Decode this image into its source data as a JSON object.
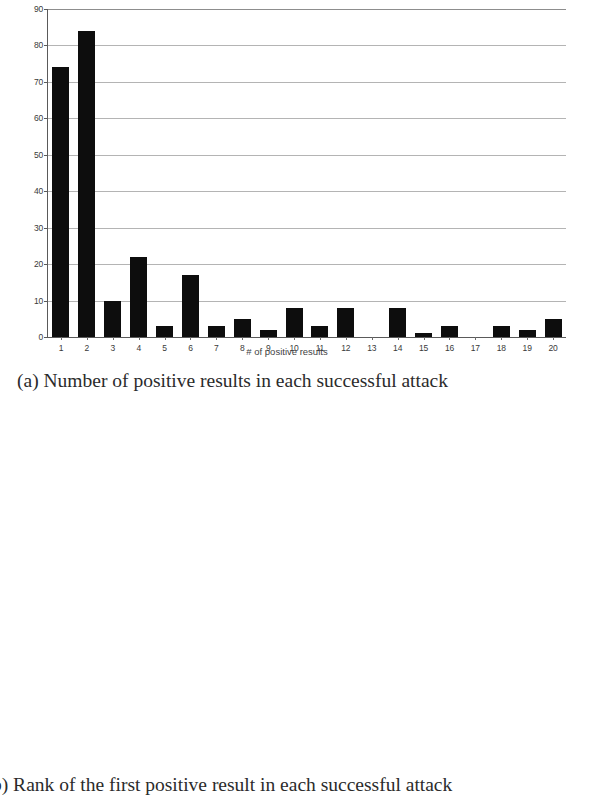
{
  "figure": {
    "caption_a": "(a) Number of positive results in each successful attack",
    "caption_b": "b) Rank of the first positive result in each successful attack"
  },
  "chart_data": [
    {
      "id": "chart-a",
      "type": "bar",
      "title": "",
      "xlabel": "# of positive results",
      "ylabel": "",
      "ylim": [
        0,
        90
      ],
      "ytick_step": 10,
      "yticks": [
        0,
        10,
        20,
        30,
        40,
        50,
        60,
        70,
        80,
        90
      ],
      "grid": true,
      "legend": "none",
      "bar_color": "#0d0d0d",
      "categories": [
        "1",
        "2",
        "3",
        "4",
        "5",
        "6",
        "7",
        "8",
        "9",
        "10",
        "11",
        "12",
        "13",
        "14",
        "15",
        "16",
        "17",
        "18",
        "19",
        "20"
      ],
      "values": [
        74,
        84,
        10,
        22,
        3,
        17,
        3,
        5,
        2,
        8,
        3,
        8,
        0,
        8,
        1,
        3,
        0,
        3,
        2,
        5
      ]
    },
    {
      "id": "chart-b",
      "type": "bar",
      "title": "",
      "xlabel": "Rank",
      "ylabel": "",
      "ylim": [
        0,
        70
      ],
      "ytick_step": 10,
      "yticks": [
        0,
        10,
        20,
        30,
        40,
        50,
        60,
        70
      ],
      "grid": true,
      "legend": "none",
      "bar_color": "#0d0d0d",
      "categories": [
        "1",
        "2",
        "3",
        "4",
        "5",
        "6",
        "7",
        "8",
        "9",
        "10",
        "11",
        "12",
        "13",
        "14",
        "15",
        "16",
        "17",
        "18",
        "19",
        "20",
        "21",
        "22",
        "23",
        "24",
        "25",
        "26",
        "27",
        "28",
        "29",
        "30",
        "31",
        "32",
        "33",
        "34",
        "35",
        "36",
        "37",
        "38",
        "39",
        "40",
        "41",
        "42",
        "43",
        "44",
        "45"
      ],
      "labeled_ticks": [
        "1",
        "3",
        "5",
        "7",
        "9",
        "11",
        "13",
        "15",
        "17",
        "19",
        "21",
        "23",
        "25",
        "27",
        "29",
        "31",
        "33",
        "35",
        "37",
        "39",
        "41",
        "43",
        "45"
      ],
      "values": [
        65,
        28,
        24,
        18,
        26,
        14,
        17,
        14,
        15,
        16,
        0,
        4,
        4,
        2,
        2,
        4,
        4,
        2,
        1,
        1,
        0,
        0,
        0,
        0,
        0,
        0,
        0,
        0,
        0,
        0,
        0,
        0,
        0,
        0,
        0,
        0,
        0,
        0,
        0,
        0,
        0,
        0,
        0,
        0,
        0
      ]
    }
  ]
}
